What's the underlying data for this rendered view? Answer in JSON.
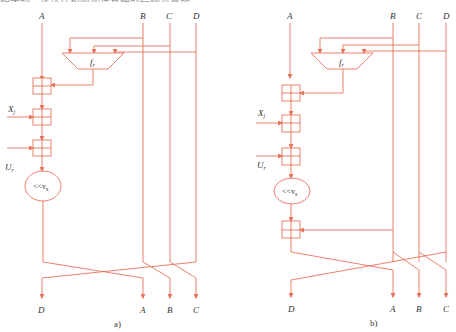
{
  "top_caption": "相关的一轮迭代和附加逆变换的结构示意图",
  "color": "#e8735c",
  "diagrams": [
    {
      "id": "a",
      "caption": "a)",
      "inputs": [
        "A",
        "B",
        "C",
        "D"
      ],
      "outputs": [
        "D",
        "A",
        "B",
        "C"
      ],
      "function_label": "f",
      "function_sub": "r",
      "x_label": "X",
      "x_sub": "j",
      "u_label": "U",
      "u_sub": "r",
      "rotate_label": "<<v",
      "rotate_sub": "s",
      "has_extra_adder": false
    },
    {
      "id": "b",
      "caption": "b)",
      "inputs": [
        "A",
        "B",
        "C",
        "D"
      ],
      "outputs": [
        "D",
        "A",
        "B",
        "C"
      ],
      "function_label": "f",
      "function_sub": "r",
      "x_label": "X",
      "x_sub": "j",
      "u_label": "U",
      "u_sub": "r",
      "rotate_label": "<<v",
      "rotate_sub": "s",
      "has_extra_adder": true
    }
  ]
}
